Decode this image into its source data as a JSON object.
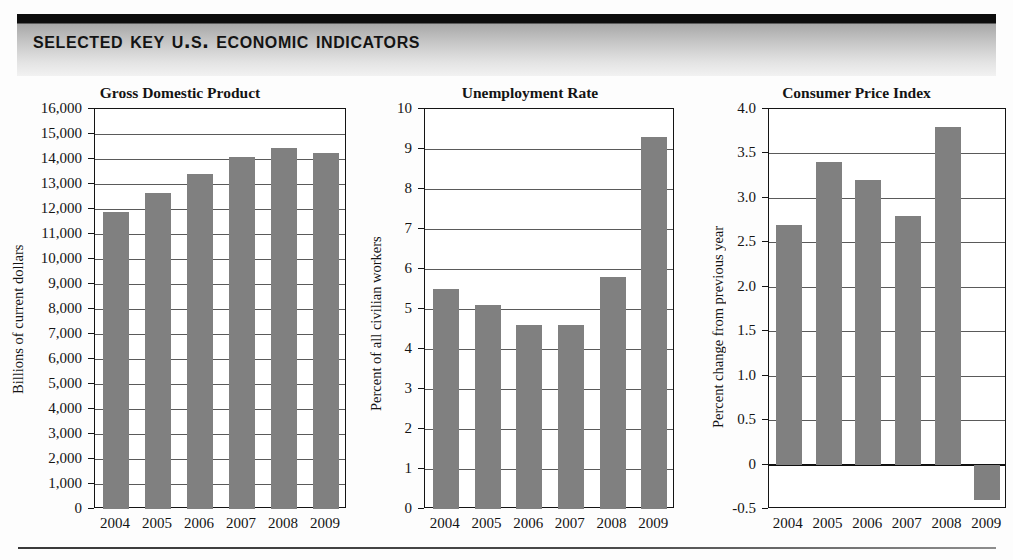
{
  "header": {
    "title": "Selected Key U.S. Economic Indicators"
  },
  "chart_data": [
    {
      "type": "bar",
      "title": "Gross Domestic Product",
      "xlabel": "",
      "ylabel": "Billions of current dollars",
      "categories": [
        "2004",
        "2005",
        "2006",
        "2007",
        "2008",
        "2009"
      ],
      "values": [
        11900,
        12640,
        13400,
        14080,
        14440,
        14260
      ],
      "ylim": [
        0,
        16000
      ],
      "ytick_values": [
        0,
        1000,
        2000,
        3000,
        4000,
        5000,
        6000,
        7000,
        8000,
        9000,
        10000,
        11000,
        12000,
        13000,
        14000,
        15000,
        16000
      ],
      "ytick_labels": [
        "0",
        "1,000",
        "2,000",
        "3,000",
        "4,000",
        "5,000",
        "6,000",
        "7,000",
        "8,000",
        "9,000",
        "10,000",
        "11,000",
        "12,000",
        "13,000",
        "14,000",
        "15,000",
        "16,000"
      ],
      "grid": true,
      "legend": "none",
      "bar_color": "#808080"
    },
    {
      "type": "bar",
      "title": "Unemployment Rate",
      "xlabel": "",
      "ylabel": "Percent of all civilian workers",
      "categories": [
        "2004",
        "2005",
        "2006",
        "2007",
        "2008",
        "2009"
      ],
      "values": [
        5.5,
        5.1,
        4.6,
        4.6,
        5.8,
        9.3
      ],
      "ylim": [
        0,
        10
      ],
      "ytick_values": [
        0,
        1,
        2,
        3,
        4,
        5,
        6,
        7,
        8,
        9,
        10
      ],
      "ytick_labels": [
        "0",
        "1",
        "2",
        "3",
        "4",
        "5",
        "6",
        "7",
        "8",
        "9",
        "10"
      ],
      "grid": true,
      "legend": "none",
      "bar_color": "#808080"
    },
    {
      "type": "bar",
      "title": "Consumer Price Index",
      "xlabel": "",
      "ylabel": "Percent change from previous year",
      "categories": [
        "2004",
        "2005",
        "2006",
        "2007",
        "2008",
        "2009"
      ],
      "values": [
        2.7,
        3.4,
        3.2,
        2.8,
        3.8,
        -0.4
      ],
      "ylim": [
        -0.5,
        4.0
      ],
      "ytick_values": [
        -0.5,
        0,
        0.5,
        1.0,
        1.5,
        2.0,
        2.5,
        3.0,
        3.5,
        4.0
      ],
      "ytick_labels": [
        "-0.5",
        "0",
        "0.5",
        "1.0",
        "1.5",
        "2.0",
        "2.5",
        "3.0",
        "3.5",
        "4.0"
      ],
      "grid": true,
      "legend": "none",
      "bar_color": "#808080"
    }
  ]
}
